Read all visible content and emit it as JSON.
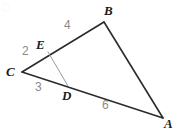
{
  "figure": {
    "kind": "geometry-diagram",
    "shape": "triangle-with-cevian-segment",
    "canvas": {
      "width": 179,
      "height": 134,
      "background": "#ffffff"
    },
    "stroke": {
      "outline_color": "#2b2b2b",
      "outline_width": 1.6,
      "inner_color": "#9a9a9a",
      "inner_width": 1.0
    },
    "points": {
      "A": {
        "x": 163,
        "y": 118
      },
      "B": {
        "x": 104,
        "y": 22
      },
      "C": {
        "x": 22,
        "y": 72
      },
      "D": {
        "x": 68,
        "y": 86
      },
      "E": {
        "x": 48,
        "y": 52
      }
    },
    "edges": [
      {
        "name": "edge-CB",
        "from": "C",
        "to": "B",
        "style": "outline"
      },
      {
        "name": "edge-BA",
        "from": "B",
        "to": "A",
        "style": "outline"
      },
      {
        "name": "edge-CA",
        "from": "C",
        "to": "A",
        "style": "outline"
      },
      {
        "name": "segment-ED",
        "from": "E",
        "to": "D",
        "style": "inner"
      }
    ],
    "vertex_labels": [
      {
        "name": "vertex-label-B",
        "text": "B",
        "x": 104,
        "y": 4
      },
      {
        "name": "vertex-label-E",
        "text": "E",
        "x": 36,
        "y": 38
      },
      {
        "name": "vertex-label-C",
        "text": "C",
        "x": 6,
        "y": 65
      },
      {
        "name": "vertex-label-D",
        "text": "D",
        "x": 62,
        "y": 89
      },
      {
        "name": "vertex-label-A",
        "text": "A",
        "x": 164,
        "y": 117
      }
    ],
    "length_labels": [
      {
        "name": "length-label-EB",
        "text": "4",
        "x": 64,
        "y": 19,
        "on_edge": "E-B"
      },
      {
        "name": "length-label-CE",
        "text": "2",
        "x": 22,
        "y": 45,
        "on_edge": "C-E"
      },
      {
        "name": "length-label-CD",
        "text": "3",
        "x": 35,
        "y": 81,
        "on_edge": "C-D"
      },
      {
        "name": "length-label-DA",
        "text": "6",
        "x": 102,
        "y": 99,
        "on_edge": "D-A"
      }
    ]
  }
}
